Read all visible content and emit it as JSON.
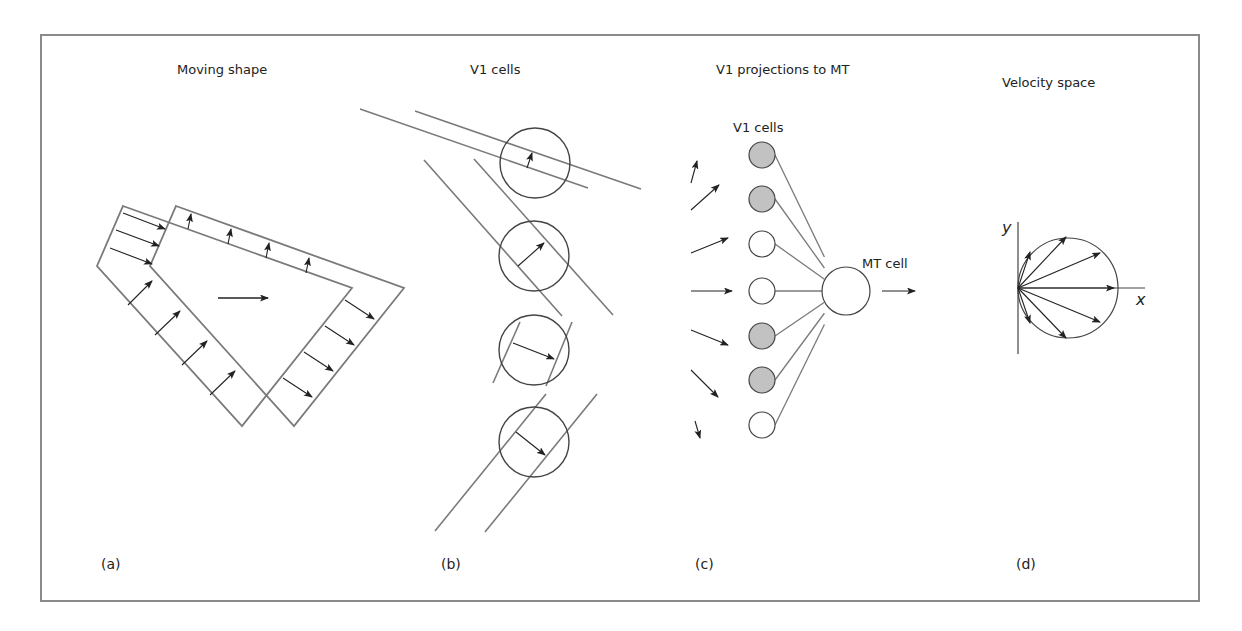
{
  "colors": {
    "frame": "#8a8a8a",
    "shape_line": "#7a7a7a",
    "ink": "#222222",
    "cell_filled": "#c2c2c2",
    "cell_empty": "#ffffff"
  },
  "panels": {
    "a": {
      "title": "Moving shape",
      "letter": "(a)",
      "shape_back": [
        [
          123,
          206
        ],
        [
          352,
          288
        ],
        [
          242,
          426
        ],
        [
          97,
          266
        ]
      ],
      "shape_front": [
        [
          176,
          206
        ],
        [
          404,
          288
        ],
        [
          294,
          426
        ],
        [
          150,
          266
        ]
      ],
      "motion_arrow": [
        [
          218,
          298
        ],
        [
          268,
          298
        ]
      ],
      "edge_arrows": [
        [
          [
            123,
            213
          ],
          [
            165,
            229
          ]
        ],
        [
          [
            116,
            230
          ],
          [
            159,
            246
          ]
        ],
        [
          [
            110,
            248
          ],
          [
            152,
            264
          ]
        ],
        [
          [
            188,
            229
          ],
          [
            191,
            214
          ]
        ],
        [
          [
            228,
            244
          ],
          [
            231,
            229
          ]
        ],
        [
          [
            266,
            258
          ],
          [
            269,
            243
          ]
        ],
        [
          [
            306,
            273
          ],
          [
            309,
            258
          ]
        ],
        [
          [
            128,
            305
          ],
          [
            152,
            281
          ]
        ],
        [
          [
            155,
            335
          ],
          [
            180,
            311
          ]
        ],
        [
          [
            182,
            365
          ],
          [
            207,
            341
          ]
        ],
        [
          [
            210,
            395
          ],
          [
            235,
            371
          ]
        ],
        [
          [
            345,
            300
          ],
          [
            374,
            319
          ]
        ],
        [
          [
            325,
            326
          ],
          [
            354,
            345
          ]
        ],
        [
          [
            304,
            352
          ],
          [
            333,
            371
          ]
        ],
        [
          [
            283,
            378
          ],
          [
            312,
            397
          ]
        ]
      ]
    },
    "b": {
      "title": "V1 cells",
      "letter": "(b)",
      "cells": [
        {
          "cx": 535,
          "cy": 163,
          "r": 35,
          "lines": [
            [
              [
                360,
                109
              ],
              [
                588,
                188
              ]
            ],
            [
              [
                415,
                111
              ],
              [
                641,
                189
              ]
            ]
          ],
          "arrow": [
            [
              527,
              168
            ],
            [
              532,
              153
            ]
          ]
        },
        {
          "cx": 534,
          "cy": 256,
          "r": 35,
          "lines": [
            [
              [
                424,
                160
              ],
              [
                562,
                316
              ]
            ],
            [
              [
                474,
                159
              ],
              [
                613,
                315
              ]
            ]
          ],
          "arrow": [
            [
              518,
              266
            ],
            [
              544,
              243
            ]
          ]
        },
        {
          "cx": 534,
          "cy": 350,
          "r": 35,
          "lines": [
            [
              [
                493,
                383
              ],
              [
                520,
                322
              ]
            ],
            [
              [
                546,
                386
              ],
              [
                572,
                322
              ]
            ]
          ],
          "arrow": [
            [
              513,
              343
            ],
            [
              554,
              359
            ]
          ]
        },
        {
          "cx": 534,
          "cy": 442,
          "r": 35,
          "lines": [
            [
              [
                435,
                531
              ],
              [
                546,
                394
              ]
            ],
            [
              [
                485,
                532
              ],
              [
                597,
                394
              ]
            ]
          ],
          "arrow": [
            [
              516,
              432
            ],
            [
              545,
              455
            ]
          ]
        }
      ]
    },
    "c": {
      "title": "V1 projections to MT",
      "letter": "(c)",
      "v1_label": "V1 cells",
      "mt_label": "MT cell",
      "mt_cell": {
        "cx": 846,
        "cy": 291,
        "r": 24
      },
      "output_arrow": [
        [
          882,
          291
        ],
        [
          915,
          291
        ]
      ],
      "v1_cells": [
        {
          "cx": 762,
          "cy": 155,
          "r": 13,
          "filled": true,
          "arrow": [
            [
              691,
              183
            ],
            [
              697,
              161
            ]
          ]
        },
        {
          "cx": 762,
          "cy": 199,
          "r": 13,
          "filled": true,
          "arrow": [
            [
              691,
              210
            ],
            [
              719,
              185
            ]
          ]
        },
        {
          "cx": 762,
          "cy": 244,
          "r": 13,
          "filled": false,
          "arrow": [
            [
              691,
              253
            ],
            [
              728,
              238
            ]
          ]
        },
        {
          "cx": 762,
          "cy": 291,
          "r": 13,
          "filled": false,
          "arrow": [
            [
              691,
              291
            ],
            [
              732,
              291
            ]
          ]
        },
        {
          "cx": 762,
          "cy": 336,
          "r": 13,
          "filled": true,
          "arrow": [
            [
              691,
              330
            ],
            [
              728,
              345
            ]
          ]
        },
        {
          "cx": 762,
          "cy": 380,
          "r": 13,
          "filled": true,
          "arrow": [
            [
              691,
              370
            ],
            [
              718,
              397
            ]
          ]
        },
        {
          "cx": 762,
          "cy": 425,
          "r": 13,
          "filled": false,
          "arrow": [
            [
              695,
              421
            ],
            [
              700,
              438
            ]
          ]
        }
      ]
    },
    "d": {
      "title": "Velocity space",
      "letter": "(d)",
      "x_label": "x",
      "y_label": "y",
      "origin": [
        1018,
        288
      ],
      "y_axis": [
        [
          1018,
          222
        ],
        [
          1018,
          354
        ]
      ],
      "x_axis": [
        [
          1018,
          288
        ],
        [
          1145,
          288
        ]
      ],
      "circle": {
        "cx": 1068,
        "cy": 288,
        "r": 50
      },
      "vectors": [
        [
          1030,
          252
        ],
        [
          1066,
          237
        ],
        [
          1100,
          253
        ],
        [
          1114,
          288
        ],
        [
          1100,
          322
        ],
        [
          1066,
          338
        ],
        [
          1030,
          323
        ]
      ]
    }
  }
}
